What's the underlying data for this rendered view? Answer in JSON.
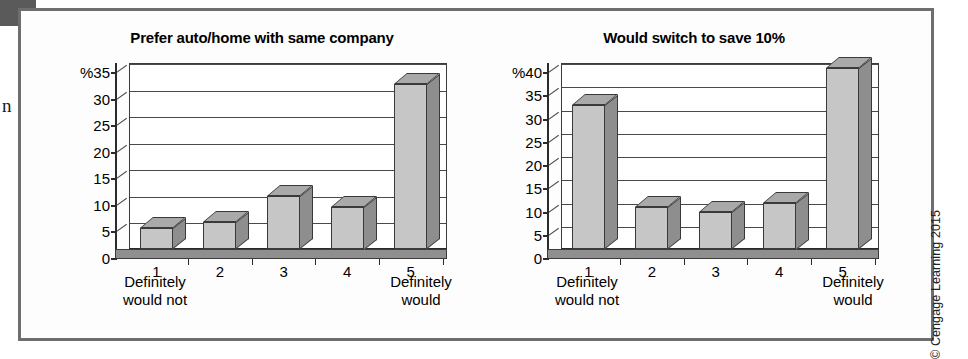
{
  "figure": {
    "copyright": "© Cengage Learning 2015",
    "cut_off_text": "n"
  },
  "colors": {
    "bar_front": "#c6c6c6",
    "bar_side": "#8e8e8e",
    "bar_top": "#a9a9a9",
    "floor": "#8f8f8f",
    "frame": "#6e6e6e",
    "axis": "#2b2b2b"
  },
  "chart_data": [
    {
      "type": "bar",
      "title": "Prefer auto/home with same company",
      "xlabel": "",
      "ylabel": "%",
      "categories": [
        "1",
        "2",
        "3",
        "4",
        "5"
      ],
      "values": [
        4,
        5,
        10,
        8,
        31
      ],
      "ylim": [
        0,
        35
      ],
      "yticks": [
        0,
        5,
        10,
        15,
        20,
        25,
        30,
        35
      ],
      "ytick_labels": [
        "0",
        "5",
        "10",
        "15",
        "20",
        "25",
        "30",
        "%35"
      ],
      "grid": true,
      "legend": "none",
      "anchor_low": "Definitely\nwould not",
      "anchor_low_line1": "Definitely",
      "anchor_low_line2": "would not",
      "anchor_high_line1": "Definitely",
      "anchor_high_line2": "would"
    },
    {
      "type": "bar",
      "title": "Would switch to save 10%",
      "xlabel": "",
      "ylabel": "%",
      "categories": [
        "1",
        "2",
        "3",
        "4",
        "5"
      ],
      "values": [
        31,
        9,
        8,
        10,
        39
      ],
      "ylim": [
        0,
        40
      ],
      "yticks": [
        0,
        5,
        10,
        15,
        20,
        25,
        30,
        35,
        40
      ],
      "ytick_labels": [
        "0",
        "5",
        "10",
        "15",
        "20",
        "25",
        "30",
        "35",
        "%40"
      ],
      "grid": true,
      "legend": "none",
      "anchor_low_line1": "Definitely",
      "anchor_low_line2": "would not",
      "anchor_high_line1": "Definitely",
      "anchor_high_line2": "would"
    }
  ]
}
